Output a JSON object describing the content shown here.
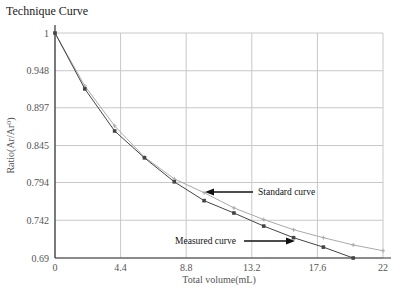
{
  "chart_data": {
    "type": "line",
    "title": "Technique Curve",
    "xlabel": "Total volume(mL)",
    "ylabel": "Ratio(Ar/Ar⁰)",
    "xlim": [
      0,
      22
    ],
    "ylim": [
      0.69,
      1
    ],
    "x_ticks": [
      "0",
      "4.4",
      "8.8",
      "13.2",
      "17.6",
      "22"
    ],
    "y_ticks": [
      "1",
      "0.948",
      "0.897",
      "0.845",
      "0.794",
      "0.742",
      "0.69"
    ],
    "grid": true,
    "series": [
      {
        "name": "Measured curve",
        "color": "#444444",
        "x": [
          0,
          2,
          4,
          6,
          8,
          10,
          12,
          14,
          16,
          18,
          20
        ],
        "values": [
          1.0,
          0.923,
          0.865,
          0.828,
          0.795,
          0.769,
          0.752,
          0.734,
          0.718,
          0.705,
          0.69
        ]
      },
      {
        "name": "Standard curve",
        "color": "#aaaaaa",
        "x": [
          0,
          2,
          4,
          6,
          8,
          10,
          12,
          14,
          16,
          18,
          20,
          22
        ],
        "values": [
          1.0,
          0.927,
          0.872,
          0.829,
          0.799,
          0.78,
          0.759,
          0.743,
          0.729,
          0.718,
          0.708,
          0.7
        ]
      }
    ],
    "annotations": [
      {
        "text": "Standard curve",
        "arrow_to_series": "Standard curve"
      },
      {
        "text": "Measured curve",
        "arrow_to_series": "Measured curve"
      }
    ]
  }
}
